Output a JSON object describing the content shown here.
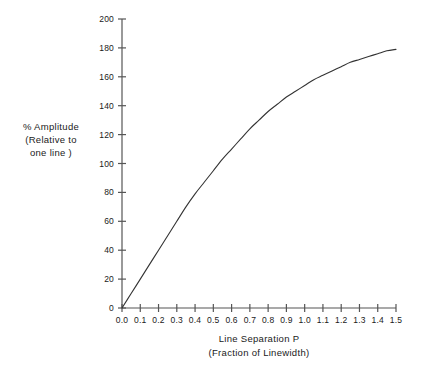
{
  "chart_data": {
    "type": "line",
    "title": "",
    "xlabel": "Line Separation P",
    "xlabel_sub": "(Fraction of Linewidth)",
    "ylabel": "% Amplitude",
    "ylabel_sub1": "(Relative to",
    "ylabel_sub2": "one line )",
    "xlim": [
      0.0,
      1.5
    ],
    "ylim": [
      0,
      200
    ],
    "grid": false,
    "legend": false,
    "x_ticks": [
      0.0,
      0.1,
      0.2,
      0.3,
      0.4,
      0.5,
      0.6,
      0.7,
      0.8,
      0.9,
      1.0,
      1.1,
      1.2,
      1.3,
      1.4,
      1.5
    ],
    "x_tick_labels": [
      "0.0",
      "0.1",
      "0.2",
      "0.3",
      "0.4",
      "0.5",
      "0.6",
      "0.7",
      "0.8",
      "0.9",
      "1.0",
      "1.1",
      "1.2",
      "1.3",
      "1.4",
      "1.5"
    ],
    "y_ticks": [
      0,
      20,
      40,
      60,
      80,
      100,
      120,
      140,
      160,
      180,
      200
    ],
    "y_tick_labels": [
      "0",
      "20",
      "40",
      "60",
      "80",
      "100",
      "120",
      "140",
      "160",
      "180",
      "200"
    ],
    "series": [
      {
        "name": "amplitude",
        "color": "#333333",
        "x": [
          0.0,
          0.05,
          0.1,
          0.15,
          0.2,
          0.25,
          0.3,
          0.35,
          0.4,
          0.45,
          0.5,
          0.55,
          0.6,
          0.65,
          0.7,
          0.75,
          0.8,
          0.85,
          0.9,
          0.95,
          1.0,
          1.05,
          1.1,
          1.15,
          1.2,
          1.25,
          1.3,
          1.35,
          1.4,
          1.45,
          1.5
        ],
        "values": [
          0,
          10,
          20,
          30,
          40,
          50,
          60,
          70,
          79,
          87,
          95,
          103,
          110,
          117,
          124,
          130,
          136,
          141,
          146,
          150,
          154,
          158,
          161,
          164,
          167,
          170,
          172,
          174,
          176,
          178,
          179
        ]
      }
    ]
  }
}
